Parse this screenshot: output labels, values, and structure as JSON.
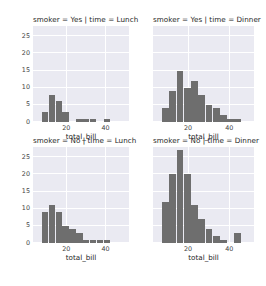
{
  "figure": {
    "width": 266,
    "height": 286,
    "background_color": "#ffffff",
    "axes_background_color": "#eaeaf2",
    "grid_color": "#ffffff",
    "bar_color": "#6e6e6e",
    "tick_color": "#444444"
  },
  "chart_data": {
    "type": "bar",
    "title": "",
    "subtitle": "",
    "xlabel": "total_bill",
    "ylabel": "",
    "xlim": [
      3,
      52
    ],
    "ylim": [
      0,
      28
    ],
    "xticks": [
      20,
      40
    ],
    "yticks": [
      0,
      5,
      10,
      15,
      20,
      25
    ],
    "grid": true,
    "legend": "none",
    "bin_width": 3.5,
    "facet_rows": [
      "smoker = Yes",
      "smoker = No"
    ],
    "facet_cols": [
      "time = Lunch",
      "time = Dinner"
    ],
    "panels": [
      {
        "id": "panel-yes-lunch",
        "title": "smoker = Yes | time = Lunch",
        "row": 0,
        "col": 0,
        "xlabel": "total_bill",
        "xticks": [
          20,
          40
        ],
        "yticks": [
          0,
          5,
          10,
          15,
          20,
          25
        ],
        "bin_edges": [
          7.5,
          11.0,
          14.5,
          18.0,
          21.5,
          25.0,
          28.5,
          32.0,
          35.5,
          39.0,
          42.5
        ],
        "values": [
          3,
          8,
          6,
          3,
          0,
          1,
          1,
          1,
          0,
          1
        ]
      },
      {
        "id": "panel-yes-dinner",
        "title": "smoker = Yes | time = Dinner",
        "row": 0,
        "col": 1,
        "xlabel": "total_bill",
        "xticks": [
          20,
          40
        ],
        "yticks": [
          0,
          5,
          10,
          15,
          20,
          25
        ],
        "bin_edges": [
          7.5,
          11.0,
          14.5,
          18.0,
          21.5,
          25.0,
          28.5,
          32.0,
          35.5,
          39.0,
          42.5,
          46.0,
          49.5
        ],
        "values": [
          4,
          9,
          15,
          10,
          12,
          8,
          5,
          4,
          2,
          1,
          1,
          0
        ]
      },
      {
        "id": "panel-no-lunch",
        "title": "smoker = No | time = Lunch",
        "row": 1,
        "col": 0,
        "xlabel": "total_bill",
        "xticks": [
          20,
          40
        ],
        "yticks": [
          0,
          5,
          10,
          15,
          20,
          25
        ],
        "bin_edges": [
          7.5,
          11.0,
          14.5,
          18.0,
          21.5,
          25.0,
          28.5,
          32.0,
          35.5,
          39.0,
          42.5
        ],
        "values": [
          9,
          11,
          9,
          5,
          4,
          3,
          1,
          1,
          1,
          1
        ]
      },
      {
        "id": "panel-no-dinner",
        "title": "smoker = No | time = Dinner",
        "row": 1,
        "col": 1,
        "xlabel": "total_bill",
        "xticks": [
          20,
          40
        ],
        "yticks": [
          0,
          5,
          10,
          15,
          20,
          25
        ],
        "bin_edges": [
          7.5,
          11.0,
          14.5,
          18.0,
          21.5,
          25.0,
          28.5,
          32.0,
          35.5,
          39.0,
          42.5,
          46.0,
          49.5
        ],
        "values": [
          12,
          20,
          27,
          20,
          11,
          7,
          4,
          2,
          1,
          0,
          3,
          0
        ]
      }
    ]
  }
}
